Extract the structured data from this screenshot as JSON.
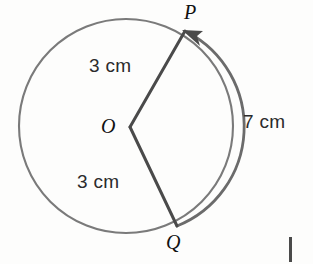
{
  "figure": {
    "type": "circle-sector-diagram",
    "background_color": "#fdfdfc",
    "stroke_color_circle": "#7a7a7a",
    "stroke_color_radius": "#4a4a4a",
    "stroke_color_arc": "#6b6b6b",
    "labels": {
      "center": "O",
      "point_p": "P",
      "point_q": "Q",
      "radius_top": "3 cm",
      "radius_bottom": "3 cm",
      "arc_length": "7 cm"
    },
    "geometry": {
      "center_x": 126,
      "center_y": 126,
      "radius_px": 107,
      "vertex_x": 130,
      "vertex_y": 127,
      "point_p_x": 185,
      "point_p_y": 31,
      "point_q_x": 177,
      "point_q_y": 226,
      "arc_direction": "counterclockwise-from-Q-to-P",
      "arrow_at": "P"
    },
    "corner_mark": {
      "name": "page-edge-mark",
      "x": 289,
      "y": 237,
      "width": 3,
      "height": 25,
      "color": "#4a4a4a"
    }
  }
}
